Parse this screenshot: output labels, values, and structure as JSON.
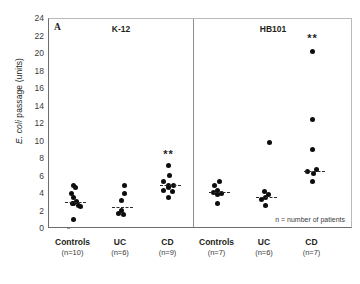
{
  "figure": {
    "panel_label": "A",
    "note": "n = number of patients",
    "y_axis_title_prefix": "E. coli",
    "y_axis_title_suffix": " passage (units)"
  },
  "chart_data": {
    "type": "scatter",
    "title": "A",
    "xlabel": "",
    "ylabel": "E. coli passage (units)",
    "ylim": [
      0,
      24
    ],
    "yticks": [
      0,
      2,
      4,
      6,
      8,
      10,
      12,
      14,
      16,
      18,
      20,
      22,
      24
    ],
    "grid": false,
    "legend": null,
    "annotations": [
      {
        "text": "**",
        "group": "K-12 CD",
        "y": 8.6
      },
      {
        "text": "**",
        "group": "HB101 CD",
        "y": 21.8
      },
      {
        "text": "n = number of patients",
        "position": "inside-bottom-right"
      }
    ],
    "panels": [
      {
        "name": "K-12",
        "groups": [
          {
            "label": "Controls",
            "n_label": "(n=10)",
            "n": 10,
            "mean": 3.0,
            "values": [
              5.0,
              4.7,
              4.1,
              3.6,
              3.2,
              2.9,
              2.6,
              2.9,
              2.7,
              1.1
            ]
          },
          {
            "label": "UC",
            "n_label": "(n=6)",
            "n": 6,
            "mean": 2.5,
            "values": [
              5.0,
              4.1,
              3.3,
              2.1,
              1.8,
              1.7
            ]
          },
          {
            "label": "CD",
            "n_label": "(n=9)",
            "n": 9,
            "mean": 5.0,
            "values": [
              7.3,
              6.1,
              5.4,
              5.0,
              5.0,
              4.7,
              4.4,
              4.3,
              3.6
            ]
          }
        ]
      },
      {
        "name": "HB101",
        "groups": [
          {
            "label": "Controls",
            "n_label": "(n=7)",
            "n": 7,
            "mean": 4.2,
            "values": [
              5.4,
              5.0,
              4.4,
              4.2,
              4.1,
              3.9,
              2.9
            ]
          },
          {
            "label": "UC",
            "n_label": "(n=6)",
            "n": 6,
            "mean": 3.6,
            "values": [
              9.9,
              4.3,
              3.9,
              3.6,
              3.4,
              2.7
            ]
          },
          {
            "label": "CD",
            "n_label": "(n=7)",
            "n": 7,
            "mean": 6.6,
            "values": [
              20.3,
              12.5,
              9.1,
              6.8,
              6.6,
              6.3,
              5.4
            ]
          }
        ]
      }
    ]
  }
}
